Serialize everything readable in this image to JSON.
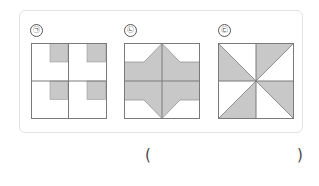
{
  "problem": {
    "figures": [
      {
        "id": "fig1",
        "label": "㉠",
        "description": "2x2 grid square with a small shaded square in the top-right corner of each quadrant"
      },
      {
        "id": "fig2",
        "label": "㉡",
        "description": "2x2 grid square with shaded horizontal band and central diamond reaching top and bottom"
      },
      {
        "id": "fig3",
        "label": "㉢",
        "description": "2x2 grid square with diagonals, alternating shaded triangles forming a pinwheel"
      }
    ],
    "answer_open": "(",
    "answer_close": ")"
  },
  "colors": {
    "shade": "#c8c8c8",
    "line": "#7a7a7a",
    "panel_border": "#e3e3e3"
  }
}
